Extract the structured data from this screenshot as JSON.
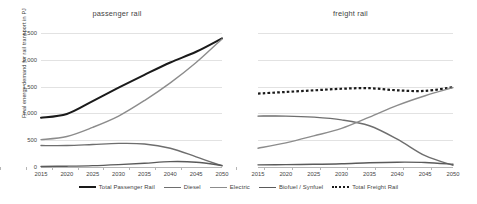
{
  "axis": {
    "ylabel": "Final energy demand for rail transport in PJ",
    "yticks": [
      "0",
      "500",
      "1,000",
      "1,500",
      "2,000",
      "2,500"
    ],
    "ytick_values": [
      0,
      500,
      1000,
      1500,
      2000,
      2500
    ],
    "xticks": [
      "2015",
      "2020",
      "2025",
      "2030",
      "2035",
      "2040",
      "2045",
      "2050"
    ]
  },
  "legend": {
    "items": [
      {
        "label": "Total Passenger Rail",
        "color": "#1a1a1a",
        "style": "solid",
        "width": 2.1
      },
      {
        "label": "Diesel",
        "color": "#6e6e6e",
        "style": "solid",
        "width": 1.5
      },
      {
        "label": "Electric",
        "color": "#8c8c8c",
        "style": "solid",
        "width": 1.5
      },
      {
        "label": "Biofuel / Synfuel",
        "color": "#5a5a5a",
        "style": "solid",
        "width": 1.5
      },
      {
        "label": "Total Freight Rail",
        "color": "#1a1a1a",
        "style": "dotted",
        "width": 2.2
      }
    ]
  },
  "chart_data": [
    {
      "type": "line",
      "title": "passenger rail",
      "xlabel": "",
      "ylabel": "Final energy demand for rail transport in PJ",
      "x": [
        2015,
        2020,
        2025,
        2030,
        2035,
        2040,
        2045,
        2050
      ],
      "xlim": [
        2015,
        2050
      ],
      "ylim": [
        0,
        2500
      ],
      "grid": true,
      "legend_position": "bottom",
      "series": [
        {
          "name": "Total Passenger Rail",
          "color": "#1a1a1a",
          "style": "solid",
          "values": [
            920,
            990,
            1230,
            1480,
            1720,
            1950,
            2150,
            2400
          ]
        },
        {
          "name": "Diesel",
          "color": "#6e6e6e",
          "style": "solid",
          "values": [
            400,
            400,
            420,
            440,
            430,
            350,
            190,
            20
          ]
        },
        {
          "name": "Electric",
          "color": "#8c8c8c",
          "style": "solid",
          "values": [
            510,
            570,
            740,
            950,
            1240,
            1570,
            1950,
            2390
          ]
        },
        {
          "name": "Biofuel / Synfuel",
          "color": "#5a5a5a",
          "style": "solid",
          "values": [
            10,
            15,
            25,
            45,
            70,
            100,
            90,
            30
          ]
        }
      ]
    },
    {
      "type": "line",
      "title": "freight rail",
      "xlabel": "",
      "ylabel": "",
      "x": [
        2015,
        2020,
        2025,
        2030,
        2035,
        2040,
        2045,
        2050
      ],
      "xlim": [
        2015,
        2050
      ],
      "ylim": [
        0,
        2500
      ],
      "grid": true,
      "legend_position": "bottom",
      "series": [
        {
          "name": "Total Freight Rail",
          "color": "#1a1a1a",
          "style": "dotted",
          "values": [
            1370,
            1400,
            1430,
            1460,
            1470,
            1430,
            1420,
            1490
          ]
        },
        {
          "name": "Diesel",
          "color": "#6e6e6e",
          "style": "solid",
          "values": [
            950,
            950,
            930,
            880,
            770,
            520,
            210,
            30
          ]
        },
        {
          "name": "Electric",
          "color": "#8c8c8c",
          "style": "solid",
          "values": [
            350,
            450,
            580,
            720,
            930,
            1150,
            1330,
            1480
          ]
        },
        {
          "name": "Biofuel / Synfuel",
          "color": "#5a5a5a",
          "style": "solid",
          "values": [
            40,
            45,
            50,
            60,
            80,
            90,
            85,
            50
          ]
        }
      ]
    }
  ]
}
